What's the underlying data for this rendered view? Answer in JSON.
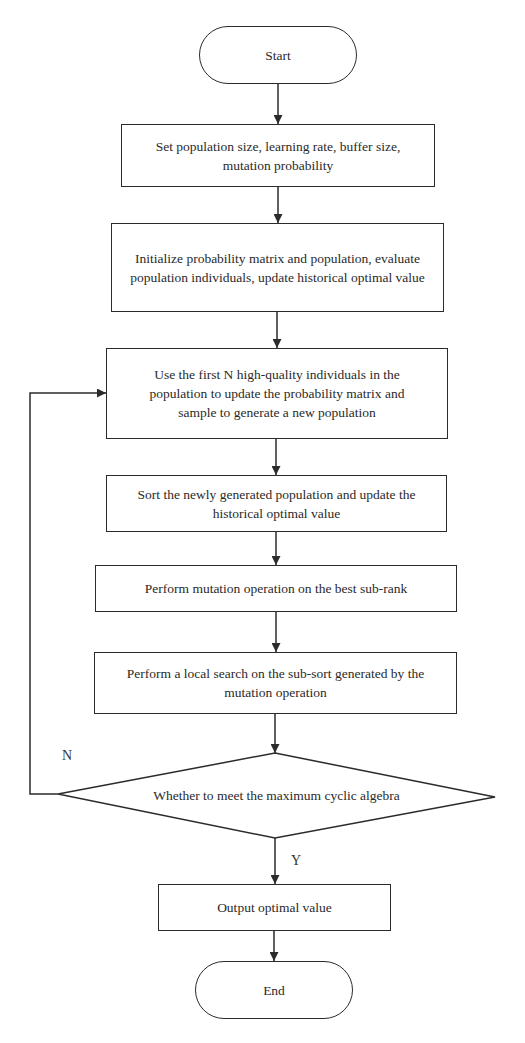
{
  "flowchart": {
    "start": {
      "label": "Start"
    },
    "steps": [
      {
        "label": "Set population size, learning rate, buffer size, mutation probability"
      },
      {
        "label": "Initialize probability matrix and population, evaluate population individuals, update historical optimal value"
      },
      {
        "label": "Use the first N high-quality individuals in the population to update the probability matrix and sample to generate a new population"
      },
      {
        "label": "Sort the newly generated population and update the historical optimal value"
      },
      {
        "label": "Perform mutation operation on the best sub-rank"
      },
      {
        "label": "Perform a local search on the sub-sort generated by the mutation operation"
      }
    ],
    "decision": {
      "label": "Whether to meet the maximum cyclic algebra",
      "no_label": "N",
      "yes_label": "Y"
    },
    "output": {
      "label": "Output optimal value"
    },
    "end": {
      "label": "End"
    }
  },
  "colors": {
    "stroke": "#2b2b2b",
    "background": "#ffffff"
  }
}
